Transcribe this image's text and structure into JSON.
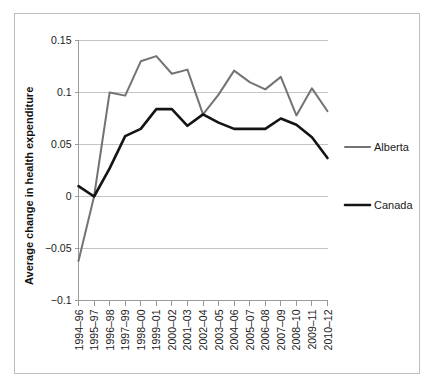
{
  "chart_data": {
    "type": "line",
    "title": "",
    "xlabel": "",
    "ylabel": "Average change in health expenditure",
    "ylim": [
      -0.1,
      0.15
    ],
    "yticks": [
      0.15,
      0.1,
      0.05,
      0,
      -0.05,
      -0.1
    ],
    "ytick_labels": [
      "0.15",
      "0.1",
      "0.05",
      "0",
      "−0.05",
      "−0.1"
    ],
    "grid": true,
    "legend_position": "right",
    "categories": [
      "1994–96",
      "1995–97",
      "1996–98",
      "1997–99",
      "1998–00",
      "1999–01",
      "2000–02",
      "2001–03",
      "2002–04",
      "2003–05",
      "2004–06",
      "2005–07",
      "2006–08",
      "2007–09",
      "2008–10",
      "2009–11",
      "2010–12"
    ],
    "series": [
      {
        "name": "Alberta",
        "color": "#737373",
        "values": [
          -0.062,
          0.0,
          0.1,
          0.097,
          0.13,
          0.135,
          0.118,
          0.122,
          0.079,
          0.098,
          0.121,
          0.11,
          0.103,
          0.115,
          0.078,
          0.104,
          0.082
        ]
      },
      {
        "name": "Canada",
        "color": "#141414",
        "values": [
          0.01,
          0.0,
          0.027,
          0.058,
          0.065,
          0.084,
          0.084,
          0.068,
          0.079,
          0.071,
          0.065,
          0.065,
          0.065,
          0.075,
          0.069,
          0.057,
          0.037
        ]
      }
    ]
  },
  "legend": {
    "items": [
      {
        "label": "Alberta",
        "color": "#737373"
      },
      {
        "label": "Canada",
        "color": "#141414"
      }
    ]
  },
  "axis": {
    "y_title": "Average change in health expenditure"
  }
}
